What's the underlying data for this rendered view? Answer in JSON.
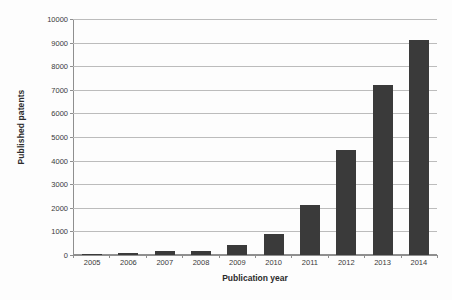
{
  "chart_data": {
    "type": "bar",
    "title": "",
    "xlabel": "Publication year",
    "ylabel": "Published patents",
    "categories": [
      "2005",
      "2006",
      "2007",
      "2008",
      "2009",
      "2010",
      "2011",
      "2012",
      "2013",
      "2014"
    ],
    "values": [
      50,
      100,
      150,
      180,
      420,
      900,
      2100,
      4450,
      7200,
      9100
    ],
    "ylim": [
      0,
      10000
    ],
    "ytick_labels": [
      "0",
      "1000",
      "2000",
      "3000",
      "4000",
      "5000",
      "6000",
      "7000",
      "8000",
      "9000",
      "10000"
    ],
    "ytick_values": [
      0,
      1000,
      2000,
      3000,
      4000,
      5000,
      6000,
      7000,
      8000,
      9000,
      10000
    ],
    "grid": true,
    "legend": "none",
    "bar_color": "#3a3a3a",
    "gridline_color": "#bcbcbc",
    "axis_color": "#8f8f8f",
    "background_color": "#fdfdfd"
  }
}
